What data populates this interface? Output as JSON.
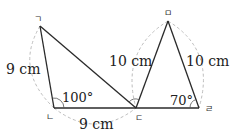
{
  "diagram": {
    "vertices": {
      "g": {
        "label": "ㄱ",
        "x": 40,
        "y": 26
      },
      "n": {
        "label": "ㄴ",
        "x": 54,
        "y": 108
      },
      "d": {
        "label": "ㄷ",
        "x": 136,
        "y": 108
      },
      "r": {
        "label": "ㄹ",
        "x": 199,
        "y": 108
      },
      "m": {
        "label": "ㅁ",
        "x": 168,
        "y": 21
      }
    },
    "measurements": {
      "side_gn": "9 cm",
      "side_nd": "9 cm",
      "side_md": "10 cm",
      "side_mr": "10 cm"
    },
    "angles": {
      "angle_n": "100°",
      "angle_r": "70°"
    },
    "colors": {
      "edge": "#2a2a2a",
      "dashed_arc": "#bdbdbd",
      "text": "#222222"
    }
  }
}
